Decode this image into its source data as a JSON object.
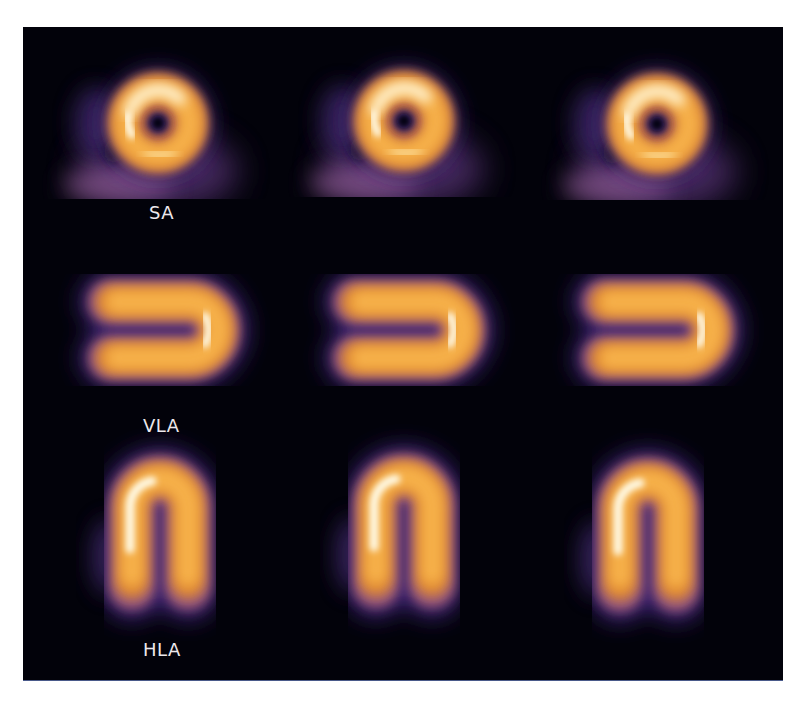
{
  "figure": {
    "background_color": "#02020a",
    "colormap": [
      "#02020a",
      "#2a1a5a",
      "#7a4a8a",
      "#d2772a",
      "#f5ad45",
      "#fde6a8",
      "#fffbe8"
    ],
    "rows": [
      {
        "id": "sa",
        "label": "SA",
        "slices": 3
      },
      {
        "id": "vla",
        "label": "VLA",
        "slices": 3
      },
      {
        "id": "hla",
        "label": "HLA",
        "slices": 3
      }
    ]
  }
}
